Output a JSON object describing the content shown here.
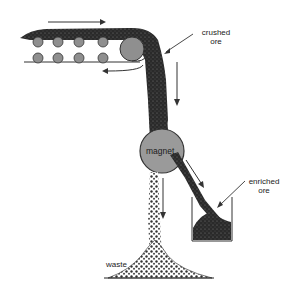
{
  "diagram": {
    "labels": {
      "crushed_ore_line1": "crushed",
      "crushed_ore_line2": "ore",
      "magnet": "magnet",
      "enriched_ore_line1": "enriched",
      "enriched_ore_line2": "ore",
      "waste": "waste"
    },
    "components": [
      "conveyor belt",
      "rollers",
      "drive pulley",
      "magnet drum",
      "collection bin",
      "waste pile"
    ],
    "flow_arrows": [
      "conveyor top (rightward)",
      "conveyor return (leftward)",
      "ore falling (down)",
      "enriched ore (down-right)",
      "waste falling (down)"
    ],
    "colors": {
      "ore": "#2a2a2a",
      "roller": "#8f8f8f",
      "magnet": "#9a9a9a",
      "line": "#333333"
    }
  }
}
